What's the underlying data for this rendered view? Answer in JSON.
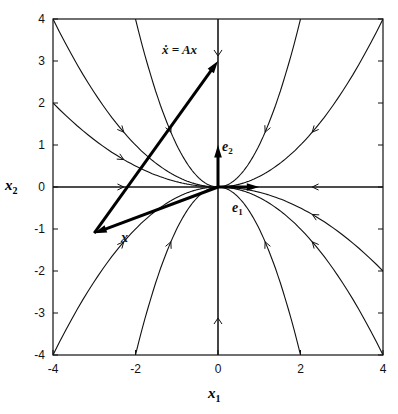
{
  "chart_data": {
    "type": "line",
    "xlabel": "x1",
    "ylabel": "x2",
    "xlim": [
      -4,
      4
    ],
    "ylim": [
      -4,
      4
    ],
    "xticks": [
      "-4",
      "-2",
      "0",
      "2",
      "4"
    ],
    "yticks": [
      "4",
      "3",
      "2",
      "1",
      "0",
      "-1",
      "-2",
      "-3",
      "-4"
    ],
    "grid": false,
    "annotations": {
      "eq": "ẋ = Ax",
      "x_vec": "x",
      "e1": "e1",
      "e2": "e2"
    },
    "vectors": [
      {
        "name": "x",
        "from": [
          0,
          0
        ],
        "to": [
          -3,
          -1.1
        ]
      },
      {
        "name": "Ax",
        "from": [
          -3,
          -1.1
        ],
        "to": [
          0,
          3
        ]
      },
      {
        "name": "e1",
        "from": [
          0,
          0
        ],
        "to": [
          1,
          0
        ]
      },
      {
        "name": "e2",
        "from": [
          0,
          0
        ],
        "to": [
          0,
          1
        ]
      }
    ],
    "trajectories_start_points": [
      [
        -4,
        4
      ],
      [
        -4,
        2
      ],
      [
        -2,
        4
      ],
      [
        0,
        4
      ],
      [
        2,
        4
      ],
      [
        4,
        4
      ],
      [
        -4,
        0
      ],
      [
        4,
        0
      ],
      [
        -4,
        -4
      ],
      [
        -2,
        -4
      ],
      [
        0,
        -4
      ],
      [
        2,
        -4
      ],
      [
        4,
        -4
      ],
      [
        4,
        -2
      ]
    ]
  },
  "labels": {
    "xlabel_main": "x",
    "xlabel_sub": "1",
    "ylabel_main": "x",
    "ylabel_sub": "2"
  }
}
